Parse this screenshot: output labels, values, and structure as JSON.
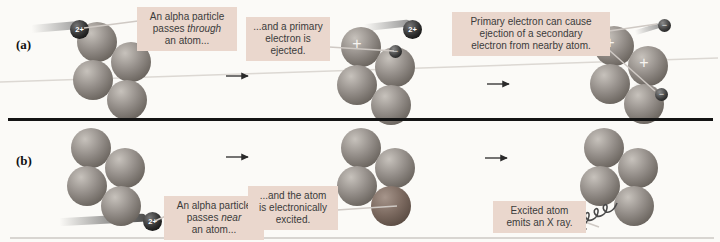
{
  "figure": {
    "panel_a": {
      "label": "(a)",
      "captions": {
        "step1": {
          "before": "An alpha particle\npasses ",
          "emphasis": "through",
          "after": "\nan atom..."
        },
        "step2": {
          "text": "...and a primary\nelectron is\nejected."
        },
        "step3": {
          "text": "Primary electron can cause\nejection of a secondary\nelectron from nearby atom."
        }
      }
    },
    "panel_b": {
      "label": "(b)",
      "captions": {
        "step1": {
          "before": "An alpha particle\npasses ",
          "emphasis": "near",
          "after": "\nan atom..."
        },
        "step2": {
          "text": "...and the atom\nis electronically\nexcited."
        },
        "step3": {
          "text": "Excited atom\nemits an X ray."
        }
      }
    },
    "symbols": {
      "alpha_charge": "2+",
      "ion_charge": "+",
      "electron_charge": "−"
    },
    "icons": {
      "step_arrow": "right-arrow",
      "x_ray": "wavy-arrow"
    },
    "colors": {
      "caption_box_bg": "#ead7cd",
      "sphere_base": "#958f8a",
      "excited_sphere": "#7c6a60",
      "alpha_particle": "#0a0a0a",
      "divider": "#141414",
      "leader_line": "#cfc9c4"
    }
  }
}
